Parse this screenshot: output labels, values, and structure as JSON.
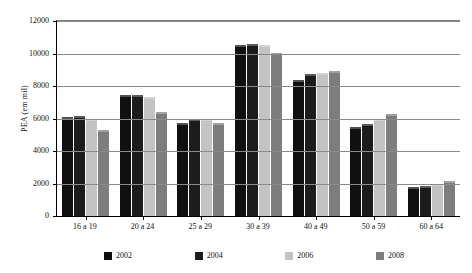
{
  "chart_data": {
    "type": "bar",
    "title": "",
    "xlabel": "",
    "ylabel": "PEA (em mil)",
    "ylim": [
      0,
      12000
    ],
    "yticks": [
      0,
      2000,
      4000,
      6000,
      8000,
      10000,
      12000
    ],
    "ytick_labels": [
      "0",
      "2000",
      "4000",
      "6000",
      "8000",
      "10000",
      "12000"
    ],
    "grid": true,
    "legend_position": "bottom",
    "categories": [
      "16 a 19",
      "20 a 24",
      "25 a 29",
      "30 a 39",
      "40 a 49",
      "50 a 59",
      "60 a 64"
    ],
    "series": [
      {
        "name": "2002",
        "color": "#101010",
        "values": [
          6100,
          7450,
          5750,
          10530,
          8380,
          5450,
          1780
        ]
      },
      {
        "name": "2004",
        "color": "#1c1c1c",
        "values": [
          6160,
          7430,
          5970,
          10600,
          8730,
          5690,
          1870
        ]
      },
      {
        "name": "2006",
        "color": "#c3c3c3",
        "values": [
          5990,
          7300,
          5980,
          10510,
          8830,
          6000,
          1960
        ]
      },
      {
        "name": "2008",
        "color": "#7d7d7d",
        "values": [
          5280,
          6430,
          5730,
          10030,
          8930,
          6270,
          2130
        ]
      }
    ]
  },
  "axis": {
    "y_title": "PEA (em mil)"
  }
}
